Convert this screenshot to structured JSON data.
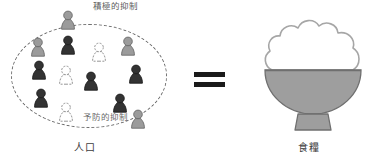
{
  "diagram": {
    "title_visible": false,
    "left": {
      "label_population": "人口",
      "label_positive_check": "積極的抑制",
      "label_preventive_check": "予防的抑制",
      "boundary_shape": "dashed-ellipse",
      "figures": [
        {
          "id": "f01",
          "x": 60,
          "y": 9,
          "tone": "gray",
          "position": "top-outside"
        },
        {
          "id": "f02",
          "x": 30,
          "y": 36,
          "tone": "gray",
          "position": "inside"
        },
        {
          "id": "f03",
          "x": 60,
          "y": 34,
          "tone": "dark",
          "position": "inside"
        },
        {
          "id": "f04",
          "x": 91,
          "y": 41,
          "tone": "white",
          "position": "inside"
        },
        {
          "id": "f05",
          "x": 120,
          "y": 35,
          "tone": "gray",
          "position": "inside"
        },
        {
          "id": "f06",
          "x": 31,
          "y": 59,
          "tone": "dark",
          "position": "inside"
        },
        {
          "id": "f07",
          "x": 58,
          "y": 64,
          "tone": "white",
          "position": "inside"
        },
        {
          "id": "f08",
          "x": 83,
          "y": 70,
          "tone": "dark",
          "position": "inside"
        },
        {
          "id": "f09",
          "x": 128,
          "y": 63,
          "tone": "dark",
          "position": "inside"
        },
        {
          "id": "f10",
          "x": 33,
          "y": 87,
          "tone": "dark",
          "position": "inside"
        },
        {
          "id": "f11",
          "x": 58,
          "y": 101,
          "tone": "white",
          "position": "inside"
        },
        {
          "id": "f12",
          "x": 112,
          "y": 92,
          "tone": "dark",
          "position": "inside"
        },
        {
          "id": "f13",
          "x": 130,
          "y": 108,
          "tone": "gray",
          "position": "bottom-right-edge"
        }
      ]
    },
    "relation": {
      "symbol": "=",
      "name": "equals-sign"
    },
    "right": {
      "label_food": "食糧",
      "object": "rice-bowl",
      "rice_fill": "#ffffff",
      "bowl_fill": "#9e9e9e"
    }
  },
  "colors": {
    "figure_dark": "#333333",
    "figure_gray": "#9b9b9b",
    "figure_white": "#ffffff",
    "outline": "#5a5a5a",
    "bowl_gray": "#9e9e9e",
    "equals_black": "#1a1a1a",
    "label_text": "#3d3d3d",
    "background": "#ffffff"
  }
}
